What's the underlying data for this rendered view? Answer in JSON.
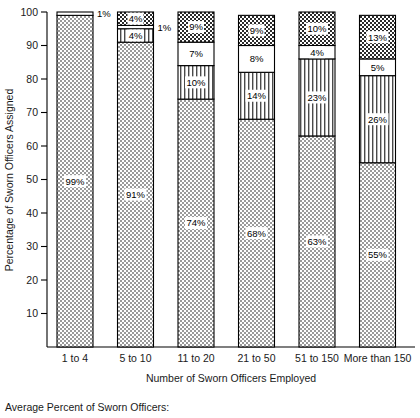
{
  "chart_data": {
    "type": "bar",
    "title": "",
    "subtitle": "",
    "xlabel": "Number of Sworn Officers Employed",
    "ylabel": "Percentage of Sworn Officers Assigned",
    "ylim": [
      0,
      100
    ],
    "yticks": [
      10,
      20,
      30,
      40,
      50,
      60,
      70,
      80,
      90,
      100
    ],
    "ytick_labels": [
      "10",
      "20",
      "30",
      "40",
      "50",
      "60",
      "70",
      "80",
      "90",
      "100"
    ],
    "grid": false,
    "legend_position": "none",
    "stacked": true,
    "categories": [
      "1 to 4",
      "5 to 10",
      "11 to 20",
      "21 to 50",
      "51 to 150",
      "More than 150"
    ],
    "series": [
      {
        "name": "segment-1-dotted",
        "pattern": "dotted",
        "values": [
          99,
          91,
          74,
          68,
          63,
          55
        ],
        "labels": [
          "99%",
          "91%",
          "74%",
          "68%",
          "63%",
          "55%"
        ]
      },
      {
        "name": "segment-2-vertical-lines",
        "pattern": "vertical-lines",
        "values": [
          0,
          4,
          10,
          14,
          23,
          26
        ],
        "labels": [
          "",
          "4%",
          "10%",
          "14%",
          "23%",
          "26%"
        ]
      },
      {
        "name": "segment-3-blank",
        "pattern": "blank",
        "values": [
          1,
          1,
          7,
          8,
          4,
          5
        ],
        "labels": [
          "1%",
          "1%",
          "7%",
          "8%",
          "4%",
          "5%"
        ]
      },
      {
        "name": "segment-4-crosshatch",
        "pattern": "crosshatch",
        "values": [
          0,
          4,
          9,
          9,
          10,
          13
        ],
        "labels": [
          "",
          "4%",
          "9%",
          "9%",
          "10%",
          "13%"
        ]
      }
    ]
  },
  "caption": {
    "text": "Average Percent of Sworn Officers:"
  },
  "colors": {
    "ink": "#000000",
    "background": "#ffffff",
    "pattern_fill": "#d8d8d8"
  }
}
